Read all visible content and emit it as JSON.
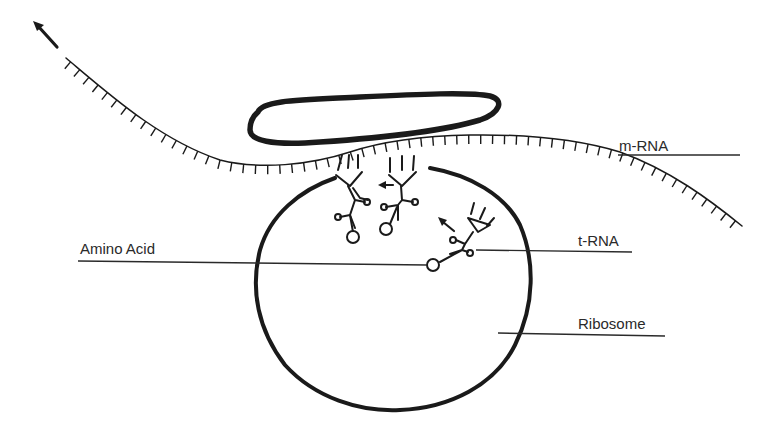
{
  "diagram": {
    "labels": {
      "mrna": "m-RNA",
      "trna": "t-RNA",
      "amino_acid": "Amino Acid",
      "ribosome": "Ribosome"
    },
    "components": [
      {
        "id": "mrna-strand",
        "kind": "strand with codon ticks"
      },
      {
        "id": "polysome-oval",
        "kind": "elongated oval above strand"
      },
      {
        "id": "ribosome",
        "kind": "large circle"
      },
      {
        "id": "trna-1",
        "kind": "tRNA bound to mRNA"
      },
      {
        "id": "trna-2",
        "kind": "tRNA bound to mRNA"
      },
      {
        "id": "trna-3",
        "kind": "tRNA leaving ribosome"
      },
      {
        "id": "direction-arrow",
        "kind": "arrow indicating mRNA direction"
      }
    ],
    "ink_color": "#1a1a1a",
    "background": "#ffffff"
  }
}
